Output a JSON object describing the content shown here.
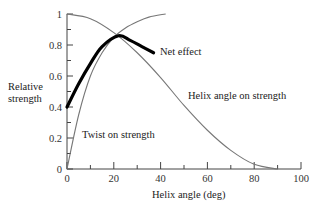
{
  "chart_data": {
    "type": "line",
    "title": "",
    "xlabel": "Helix angle (deg)",
    "ylabel": "Relative strength",
    "xlim": [
      0,
      100
    ],
    "ylim": [
      0,
      1
    ],
    "x_ticks": [
      0,
      20,
      40,
      60,
      80,
      100
    ],
    "y_ticks": [
      0,
      0.2,
      0.4,
      0.6,
      0.8,
      1
    ],
    "x_tick_labels": [
      "0",
      "20",
      "40",
      "60",
      "80",
      "100"
    ],
    "y_tick_labels": [
      "0",
      "0.2",
      "0.4",
      "0.6",
      "0.8",
      "1"
    ],
    "grid": false,
    "legend": "inline annotations",
    "series": [
      {
        "name": "Helix angle on strength",
        "color": "#777777",
        "x": [
          0,
          10,
          20,
          30,
          40,
          50,
          60,
          70,
          80,
          90
        ],
        "values": [
          1.0,
          0.97,
          0.88,
          0.75,
          0.59,
          0.41,
          0.25,
          0.12,
          0.03,
          0.0
        ]
      },
      {
        "name": "Twist on strength",
        "color": "#777777",
        "x": [
          0,
          5,
          10,
          15,
          20,
          25,
          30,
          35,
          42
        ],
        "values": [
          0.0,
          0.35,
          0.6,
          0.75,
          0.85,
          0.91,
          0.95,
          0.98,
          1.0
        ]
      },
      {
        "name": "Net effect",
        "color": "#000000",
        "x": [
          0,
          5,
          10,
          15,
          22,
          27,
          32,
          37
        ],
        "values": [
          0.4,
          0.55,
          0.68,
          0.79,
          0.86,
          0.83,
          0.79,
          0.75
        ]
      }
    ],
    "annotations": [
      "Net effect",
      "Helix angle on strength",
      "Twist on strength"
    ]
  },
  "labels": {
    "net_effect": "Net effect",
    "helix": "Helix angle on strength",
    "twist": "Twist on strength",
    "ylabel_line1": "Relative",
    "ylabel_line2": "strength",
    "xlabel": "Helix angle (deg)"
  }
}
